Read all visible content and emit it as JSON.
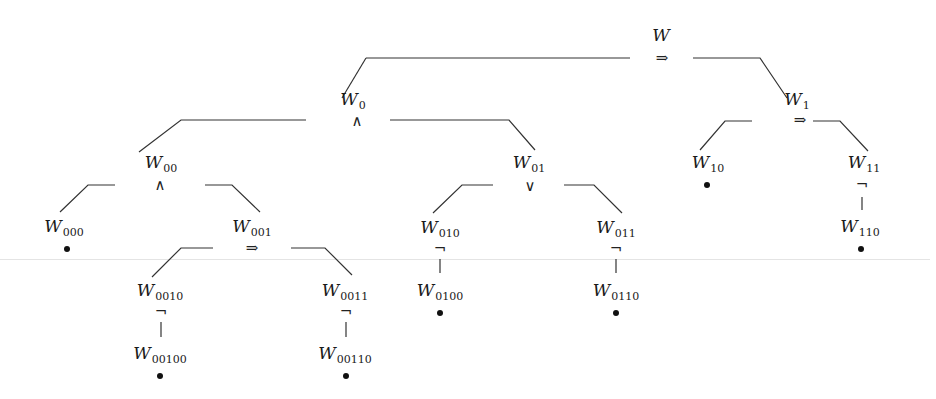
{
  "diagram": {
    "type": "formula-decomposition-tree",
    "colors": {
      "line": "#333333",
      "text": "#1a1a1a",
      "leaf_dot": "#111111",
      "background_rule": "#e4e4e4"
    },
    "nodes": [
      {
        "id": "W",
        "base": "W",
        "sub": "",
        "x": 661,
        "y": 35,
        "op": "⇒",
        "op_x": 662,
        "op_y": 58,
        "leaf": false
      },
      {
        "id": "W0",
        "base": "W",
        "sub": "0",
        "x": 353,
        "y": 101,
        "op": "∧",
        "op_x": 357,
        "op_y": 121,
        "leaf": false
      },
      {
        "id": "W1",
        "base": "W",
        "sub": "1",
        "x": 797,
        "y": 101,
        "op": "⇒",
        "op_x": 800,
        "op_y": 120,
        "leaf": false
      },
      {
        "id": "W00",
        "base": "W",
        "sub": "00",
        "x": 161,
        "y": 164,
        "op": "∧",
        "op_x": 160,
        "op_y": 185,
        "leaf": false
      },
      {
        "id": "W01",
        "base": "W",
        "sub": "01",
        "x": 529,
        "y": 164,
        "op": "∨",
        "op_x": 530,
        "op_y": 186,
        "leaf": false
      },
      {
        "id": "W10",
        "base": "W",
        "sub": "10",
        "x": 708,
        "y": 164,
        "op": "",
        "leaf": true,
        "dot_x": 707,
        "dot_y": 185
      },
      {
        "id": "W11",
        "base": "W",
        "sub": "11",
        "x": 864,
        "y": 164,
        "op": "¬",
        "op_x": 862,
        "op_y": 184,
        "leaf": false
      },
      {
        "id": "W000",
        "base": "W",
        "sub": "000",
        "x": 64,
        "y": 228,
        "op": "",
        "leaf": true,
        "dot_x": 67,
        "dot_y": 249
      },
      {
        "id": "W001",
        "base": "W",
        "sub": "001",
        "x": 252,
        "y": 228,
        "op": "⇒",
        "op_x": 252,
        "op_y": 248,
        "leaf": false
      },
      {
        "id": "W010",
        "base": "W",
        "sub": "010",
        "x": 440,
        "y": 229,
        "op": "¬",
        "op_x": 440,
        "op_y": 248,
        "leaf": false
      },
      {
        "id": "W011",
        "base": "W",
        "sub": "011",
        "x": 616,
        "y": 229,
        "op": "¬",
        "op_x": 616,
        "op_y": 248,
        "leaf": false
      },
      {
        "id": "W110",
        "base": "W",
        "sub": "110",
        "x": 860,
        "y": 228,
        "op": "",
        "leaf": true,
        "dot_x": 861,
        "dot_y": 249
      },
      {
        "id": "W0010",
        "base": "W",
        "sub": "0010",
        "x": 160,
        "y": 292,
        "op": "¬",
        "op_x": 161,
        "op_y": 311,
        "leaf": false
      },
      {
        "id": "W0011",
        "base": "W",
        "sub": "0011",
        "x": 345,
        "y": 292,
        "op": "¬",
        "op_x": 346,
        "op_y": 311,
        "leaf": false
      },
      {
        "id": "W0100",
        "base": "W",
        "sub": "0100",
        "x": 440,
        "y": 292,
        "op": "",
        "leaf": true,
        "dot_x": 440,
        "dot_y": 313
      },
      {
        "id": "W0110",
        "base": "W",
        "sub": "0110",
        "x": 616,
        "y": 292,
        "op": "",
        "leaf": true,
        "dot_x": 616,
        "dot_y": 313
      },
      {
        "id": "W00100",
        "base": "W",
        "sub": "00100",
        "x": 160,
        "y": 355,
        "op": "",
        "leaf": true,
        "dot_x": 160,
        "dot_y": 376
      },
      {
        "id": "W00110",
        "base": "W",
        "sub": "00110",
        "x": 345,
        "y": 355,
        "op": "",
        "leaf": true,
        "dot_x": 346,
        "dot_y": 376
      }
    ],
    "edges": [
      {
        "from": "W",
        "to": "W0",
        "points": "366,58 630,58 M366,58 342,98"
      },
      {
        "from": "W",
        "to": "W1",
        "points": "693,58 760,58 787,98"
      },
      {
        "from": "W0",
        "to": "W00",
        "points": "306,120 181,120 139,152"
      },
      {
        "from": "W0",
        "to": "W01",
        "points": "390,120 509,120 535,150"
      },
      {
        "from": "W1",
        "to": "W10",
        "points": "752,121 725,121 700,150"
      },
      {
        "from": "W1",
        "to": "W11",
        "points": "813,121 840,121 868,151"
      },
      {
        "from": "W00",
        "to": "W000",
        "points": "115,185 88,185 60,212"
      },
      {
        "from": "W00",
        "to": "W001",
        "points": "205,185 232,185 260,212"
      },
      {
        "from": "W01",
        "to": "W010",
        "points": "493,185 462,185 433,213"
      },
      {
        "from": "W01",
        "to": "W011",
        "points": "564,185 594,185 622,213"
      },
      {
        "from": "W11",
        "to": "W110",
        "points": "862,197 862,210"
      },
      {
        "from": "W001",
        "to": "W0010",
        "points": "213,248 181,248 152,277"
      },
      {
        "from": "W001",
        "to": "W0011",
        "points": "291,248 325,248 352,275"
      },
      {
        "from": "W010",
        "to": "W0100",
        "points": "440,259 440,273"
      },
      {
        "from": "W011",
        "to": "W0110",
        "points": "616,259 616,273"
      },
      {
        "from": "W0010",
        "to": "W00100",
        "points": "161,322 161,337"
      },
      {
        "from": "W0011",
        "to": "W00110",
        "points": "346,322 346,337"
      }
    ]
  }
}
